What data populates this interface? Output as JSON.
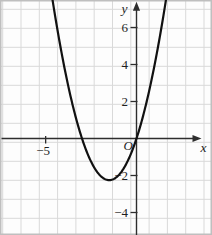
{
  "figure_colors": {
    "background": "#fdfdfd",
    "frame": "#bfbfbf",
    "grid": "#d9d9d9",
    "axis": "#2e2e2e",
    "curve": "#111111",
    "text": "#1f1f1f"
  },
  "chart_data": {
    "type": "line",
    "title": "",
    "xlabel": "x",
    "ylabel": "y",
    "origin_label": "O",
    "grid": true,
    "xlim": [
      -7.6,
      4.2
    ],
    "ylim": [
      -5.2,
      7.5
    ],
    "x_axis": {
      "label": "x",
      "ticks": [
        {
          "value": -5,
          "label": "−5"
        }
      ]
    },
    "y_axis": {
      "label": "y",
      "ticks": [
        {
          "value": 6,
          "label": "6"
        },
        {
          "value": 4,
          "label": "4"
        },
        {
          "value": 2,
          "label": "2"
        },
        {
          "value": -2,
          "label": "−2"
        },
        {
          "value": -4,
          "label": "−4"
        }
      ]
    },
    "series": [
      {
        "name": "parabola",
        "function": "y = x^2 + 3x",
        "coefficients": {
          "a": 1,
          "b": 3,
          "c": 0
        },
        "x_plot_range": [
          -4.68,
          1.68
        ],
        "points": [
          [
            -4.5,
            6.75
          ],
          [
            -4,
            4
          ],
          [
            -3.5,
            1.75
          ],
          [
            -3,
            0
          ],
          [
            -2.5,
            -1.25
          ],
          [
            -2,
            -2
          ],
          [
            -1.5,
            -2.25
          ],
          [
            -1,
            -2
          ],
          [
            -0.5,
            -1.25
          ],
          [
            0,
            0
          ],
          [
            0.5,
            1.75
          ],
          [
            1,
            4
          ],
          [
            1.5,
            6.75
          ]
        ],
        "key_points": {
          "x_intercepts": [
            -3,
            0
          ],
          "y_intercept": 0,
          "vertex": [
            -1.5,
            -2.25
          ]
        }
      }
    ]
  },
  "render": {
    "width": 212,
    "height": 235,
    "origin_px": {
      "x": 136.5,
      "y": 138.5
    },
    "px_per_unit": {
      "x": 18.17,
      "y": 18.5
    },
    "grid_px": {
      "x_start": 2.7,
      "x_step": 18.3,
      "y_start": 9.3,
      "y_step": 19
    }
  }
}
